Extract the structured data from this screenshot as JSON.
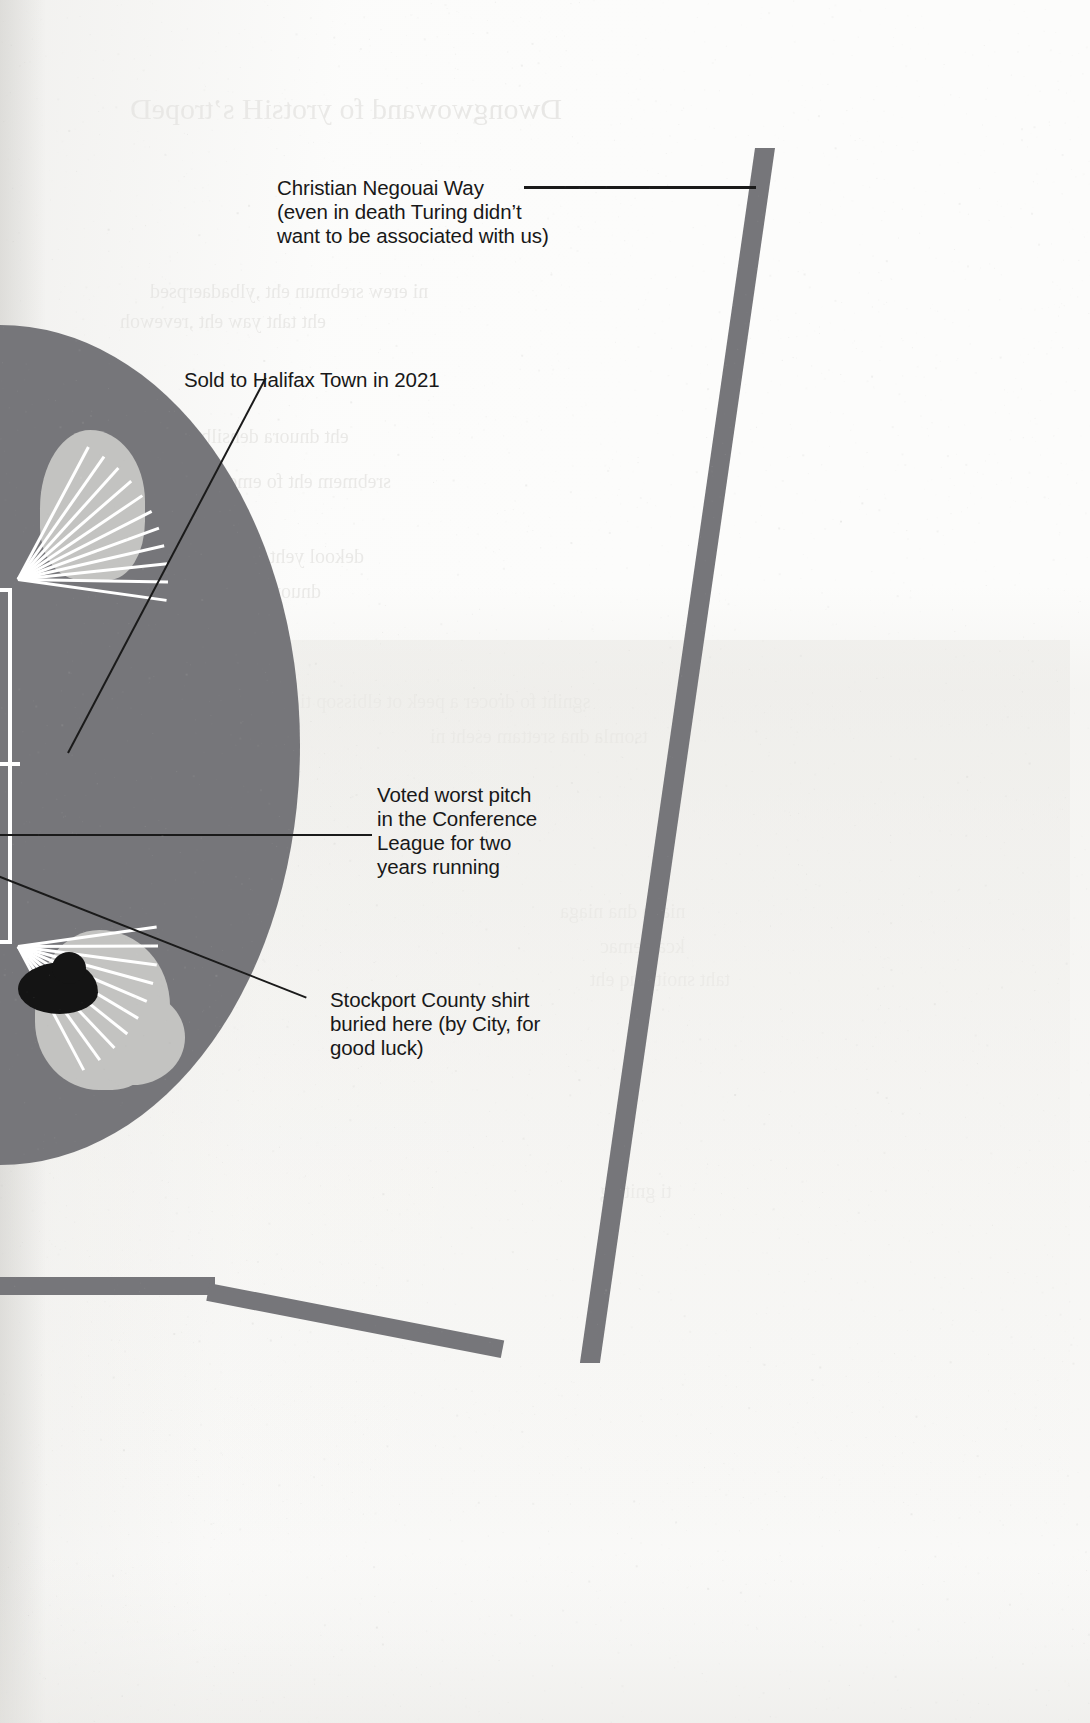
{
  "page": {
    "width": 1090,
    "height": 1723,
    "background_color": "#fcfcfb",
    "ink_color": "#181818",
    "graphic_grey": "#76767a",
    "graphic_light_grey": "#c3c3c1",
    "graphic_black": "#141414"
  },
  "annotations": [
    {
      "id": "negouai-way",
      "text": "Christian Negouai Way\n(even in death Turing didn’t\nwant to be associated with us)",
      "lines": [
        "Christian Negouai Way",
        "(even in death Turing didn’t",
        "want to be associated with us)"
      ],
      "points_to": "road-vertical"
    },
    {
      "id": "halifax-sale",
      "text": "Sold to Halifax Town in 2021",
      "lines": [
        "Sold to Halifax Town in 2021"
      ],
      "points_to": "stadium-bowl"
    },
    {
      "id": "worst-pitch",
      "text": "Voted worst pitch\nin the Conference\nLeague for two\nyears running",
      "lines": [
        "Voted worst pitch",
        "in the Conference",
        "League for two",
        "years running"
      ],
      "points_to": "pitch-area"
    },
    {
      "id": "buried-shirt",
      "text": "Stockport County shirt\nburied here (by City, for\ngood luck)",
      "lines": [
        "Stockport County shirt",
        "buried here (by City, for",
        "good luck)"
      ],
      "points_to": "black-blob-marker"
    }
  ],
  "graphic": {
    "description": "Stylised map illustration of a football stadium and adjoining roads, printed in grey on scanned book paper",
    "stadium_label": "stadium-bowl",
    "roads": [
      "road-vertical",
      "road-bottom"
    ]
  }
}
